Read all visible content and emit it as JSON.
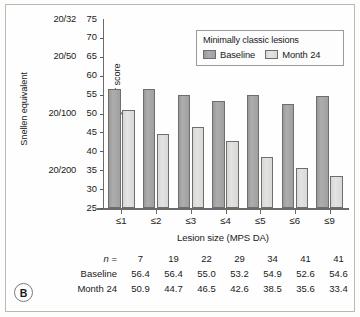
{
  "panel": {
    "label": "B"
  },
  "chart_data": {
    "type": "bar",
    "title": "",
    "xlabel": "Lesion size (MPS DA)",
    "ylabel": "Visual acuity letter score",
    "secondary_ylabel": "Snellen equivalent",
    "categories": [
      "≤1",
      "≤2",
      "≤3",
      "≤4",
      "≤5",
      "≤6",
      "≤9"
    ],
    "series": [
      {
        "name": "Baseline",
        "color": "#a3a3a3",
        "values": [
          56.4,
          56.4,
          55.0,
          53.2,
          54.9,
          52.6,
          54.6
        ]
      },
      {
        "name": "Month 24",
        "color": "#dcdcda",
        "values": [
          50.9,
          44.7,
          46.5,
          42.6,
          38.5,
          35.6,
          33.4
        ]
      }
    ],
    "ylim": [
      25,
      75
    ],
    "yticks": [
      75,
      70,
      65,
      60,
      55,
      50,
      45,
      40,
      35,
      30,
      25
    ],
    "snellen_ticks": [
      {
        "label": "20/32",
        "score": 75
      },
      {
        "label": "20/50",
        "score": 65
      },
      {
        "label": "20/100",
        "score": 50
      },
      {
        "label": "20/200",
        "score": 35
      }
    ],
    "grid": false,
    "legend_position": "top-right",
    "legend_title": "Minimally classic lesions",
    "n_values": [
      7,
      19,
      22,
      29,
      34,
      41,
      41
    ]
  },
  "legend": {
    "title": "Minimally classic lesions",
    "entries": [
      {
        "label": "Baseline"
      },
      {
        "label": "Month 24"
      }
    ]
  },
  "table": {
    "rows": [
      {
        "head_prefix": "n",
        "head_suffix": " =",
        "cells": [
          "7",
          "19",
          "22",
          "29",
          "34",
          "41",
          "41"
        ]
      },
      {
        "head": "Baseline",
        "cells": [
          "56.4",
          "56.4",
          "55.0",
          "53.2",
          "54.9",
          "52.6",
          "54.6"
        ]
      },
      {
        "head": "Month 24",
        "cells": [
          "50.9",
          "44.7",
          "46.5",
          "42.6",
          "38.5",
          "35.6",
          "33.4"
        ]
      }
    ]
  }
}
